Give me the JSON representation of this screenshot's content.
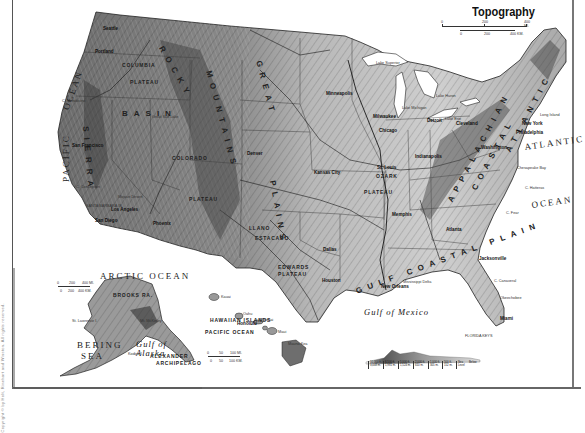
{
  "map": {
    "title": "Topography",
    "scale_main": {
      "miles": [
        "0",
        "200",
        "400 MI."
      ],
      "km": [
        "0",
        "200",
        "400 KM."
      ]
    },
    "scale_alaska": {
      "miles": [
        "0",
        "200",
        "400 MI."
      ],
      "km": [
        "0",
        "200",
        "400 KM."
      ]
    },
    "scale_hawaii": {
      "miles": [
        "0",
        "50",
        "100 MI."
      ],
      "km": [
        "0",
        "50",
        "100 KM."
      ]
    },
    "colors": {
      "land_light": "#d9d9d9",
      "land_mid": "#a8a8a8",
      "land_dark": "#5e5e5e",
      "water": "#ffffff",
      "lines": "#222222",
      "frame": "#666666"
    },
    "oceans": [
      {
        "id": "pacific",
        "text": "PACIFIC",
        "x": 62,
        "y": 182,
        "rot": -90
      },
      {
        "id": "ocean-west",
        "text": "OCEAN",
        "x": 62,
        "y": 108,
        "rot": -70
      },
      {
        "id": "atlantic",
        "text": "ATLANTIC",
        "x": 524,
        "y": 143,
        "rot": -8
      },
      {
        "id": "atlantic-ocean",
        "text": "OCEAN",
        "x": 531,
        "y": 201,
        "rot": -8
      },
      {
        "id": "arctic",
        "text": "ARCTIC OCEAN",
        "x": 100,
        "y": 272,
        "rot": 0
      },
      {
        "id": "bering",
        "text": "BERING",
        "x": 77,
        "y": 341,
        "rot": 0
      },
      {
        "id": "bering-sea",
        "text": "SEA",
        "x": 81,
        "y": 352,
        "rot": 0
      }
    ],
    "gulfs": [
      {
        "id": "gulf-of-mexico",
        "text": "Gulf of Mexico",
        "x": 364,
        "y": 308
      },
      {
        "id": "gulf-of-alaska",
        "text": "Gulf of\nAlaska",
        "x": 136,
        "y": 340
      }
    ],
    "regions": [
      {
        "id": "columbia-plateau",
        "text": "COLUMBIA",
        "x": 122,
        "y": 63
      },
      {
        "id": "columbia-plateau-2",
        "text": "PLATEAU",
        "x": 130,
        "y": 80
      },
      {
        "id": "colorado-plateau",
        "text": "COLORADO",
        "x": 172,
        "y": 156
      },
      {
        "id": "colorado-plateau-2",
        "text": "PLATEAU",
        "x": 189,
        "y": 197
      },
      {
        "id": "ozark-plateau",
        "text": "OZARK",
        "x": 376,
        "y": 174
      },
      {
        "id": "ozark-plateau-2",
        "text": "PLATEAU",
        "x": 364,
        "y": 190
      },
      {
        "id": "edwards-plateau",
        "text": "EDWARDS",
        "x": 278,
        "y": 265
      },
      {
        "id": "edwards-plateau-2",
        "text": "PLATEAU",
        "x": 278,
        "y": 272
      },
      {
        "id": "llano-estacado",
        "text": "LLANO",
        "x": 249,
        "y": 226
      },
      {
        "id": "llano-estacado-2",
        "text": "ESTACADO",
        "x": 255,
        "y": 236
      },
      {
        "id": "brooks-range",
        "text": "BROOKS RA.",
        "x": 113,
        "y": 293
      },
      {
        "id": "alexander-arch",
        "text": "ALEXANDER",
        "x": 150,
        "y": 354
      },
      {
        "id": "alexander-arch-2",
        "text": "ARCHIPELAGO",
        "x": 156,
        "y": 361
      },
      {
        "id": "hawaiian-islands",
        "text": "HAWAIIAN ISLANDS",
        "x": 210,
        "y": 318
      },
      {
        "id": "hawaii-pacific",
        "text": "PACIFIC OCEAN",
        "x": 205,
        "y": 330
      }
    ],
    "big_ranges": [
      {
        "id": "rocky",
        "text": "ROCKY",
        "x": 164,
        "y": 45,
        "rot": 60
      },
      {
        "id": "mountains",
        "text": "MOUNTAINS",
        "x": 212,
        "y": 70,
        "rot": 75
      },
      {
        "id": "great-plains",
        "text": "GREAT",
        "x": 262,
        "y": 60,
        "rot": 75
      },
      {
        "id": "plains",
        "text": "PLAINS",
        "x": 276,
        "y": 180,
        "rot": 80
      },
      {
        "id": "appalachian",
        "text": "APPALACHIAN",
        "x": 447,
        "y": 200,
        "rot": -62
      },
      {
        "id": "coastal",
        "text": "COASTAL",
        "x": 471,
        "y": 188,
        "rot": -62
      },
      {
        "id": "atlantic-plain",
        "text": "ATLANTIC",
        "x": 505,
        "y": 150,
        "rot": -62
      },
      {
        "id": "gulf-coastal-plain",
        "text": "GULF COASTAL PLAIN",
        "x": 355,
        "y": 288,
        "rot": -20
      },
      {
        "id": "sierra",
        "text": "SIERRA",
        "x": 89,
        "y": 126,
        "rot": 85
      },
      {
        "id": "basin",
        "text": "BASIN",
        "x": 122,
        "y": 110,
        "rot": 0
      }
    ],
    "cities": [
      {
        "id": "seattle",
        "text": "Seattle",
        "x": 103,
        "y": 27
      },
      {
        "id": "portland",
        "text": "Portland",
        "x": 95,
        "y": 50
      },
      {
        "id": "san-francisco",
        "text": "San Francisco",
        "x": 72,
        "y": 144
      },
      {
        "id": "los-angeles",
        "text": "Los Angeles",
        "x": 111,
        "y": 208
      },
      {
        "id": "san-diego",
        "text": "San Diego",
        "x": 95,
        "y": 219
      },
      {
        "id": "phoenix",
        "text": "Phoenix",
        "x": 153,
        "y": 222
      },
      {
        "id": "denver",
        "text": "Denver",
        "x": 247,
        "y": 152
      },
      {
        "id": "kansas-city",
        "text": "Kansas City",
        "x": 314,
        "y": 171
      },
      {
        "id": "st-louis",
        "text": "St. Louis",
        "x": 377,
        "y": 166
      },
      {
        "id": "minneapolis",
        "text": "Minneapolis",
        "x": 326,
        "y": 92
      },
      {
        "id": "milwaukee",
        "text": "Milwaukee",
        "x": 373,
        "y": 115
      },
      {
        "id": "chicago",
        "text": "Chicago",
        "x": 379,
        "y": 129
      },
      {
        "id": "detroit",
        "text": "Detroit",
        "x": 427,
        "y": 119
      },
      {
        "id": "cleveland",
        "text": "Cleveland",
        "x": 456,
        "y": 122
      },
      {
        "id": "indianapolis",
        "text": "Indianapolis",
        "x": 415,
        "y": 155
      },
      {
        "id": "new-york",
        "text": "New York",
        "x": 522,
        "y": 122
      },
      {
        "id": "philadelphia",
        "text": "Philadelphia",
        "x": 516,
        "y": 131
      },
      {
        "id": "washington",
        "text": "Washington",
        "x": 481,
        "y": 146
      },
      {
        "id": "atlanta",
        "text": "Atlanta",
        "x": 446,
        "y": 228
      },
      {
        "id": "memphis",
        "text": "Memphis",
        "x": 392,
        "y": 213
      },
      {
        "id": "dallas",
        "text": "Dallas",
        "x": 323,
        "y": 248
      },
      {
        "id": "houston",
        "text": "Houston",
        "x": 322,
        "y": 279
      },
      {
        "id": "new-orleans",
        "text": "New Orleans",
        "x": 381,
        "y": 285
      },
      {
        "id": "jacksonville",
        "text": "Jacksonville",
        "x": 479,
        "y": 257
      },
      {
        "id": "miami",
        "text": "Miami",
        "x": 500,
        "y": 317
      },
      {
        "id": "honolulu",
        "text": "Honolulu",
        "x": 237,
        "y": 322
      }
    ],
    "small_labels": [
      {
        "id": "mississippi-delta",
        "text": "Mississippi Delta",
        "x": 403,
        "y": 281
      },
      {
        "id": "florida-keys",
        "text": "FLORIDA KEYS",
        "x": 465,
        "y": 335
      },
      {
        "id": "c-canaveral",
        "text": "C. Canaveral",
        "x": 494,
        "y": 280
      },
      {
        "id": "okeechobee",
        "text": "Okeechobee",
        "x": 500,
        "y": 297
      },
      {
        "id": "chesapeake-bay",
        "text": "Chesapeake Bay",
        "x": 517,
        "y": 167
      },
      {
        "id": "c-hatteras",
        "text": "C. Hatteras",
        "x": 525,
        "y": 187
      },
      {
        "id": "c-fear",
        "text": "C. Fear",
        "x": 506,
        "y": 212
      },
      {
        "id": "long-island",
        "text": "Long Island",
        "x": 540,
        "y": 114
      },
      {
        "id": "santa-barbara",
        "text": "SANTA BARBARA IS.",
        "x": 86,
        "y": 205
      },
      {
        "id": "mojave-desert",
        "text": "Mojave Desert",
        "x": 118,
        "y": 196
      },
      {
        "id": "c-mendocino",
        "text": "C. Mendocino",
        "x": 62,
        "y": 100
      },
      {
        "id": "c-conception",
        "text": "C. Conception",
        "x": 76,
        "y": 186
      },
      {
        "id": "lake-superior",
        "text": "Lake Superior",
        "x": 376,
        "y": 62
      },
      {
        "id": "lake-michigan",
        "text": "Lake Michigan",
        "x": 402,
        "y": 107
      },
      {
        "id": "lake-huron",
        "text": "Lake Huron",
        "x": 436,
        "y": 95
      },
      {
        "id": "lake-erie",
        "text": "Lake Erie",
        "x": 445,
        "y": 118
      },
      {
        "id": "great-salt-lake",
        "text": "Great Salt Lake",
        "x": 152,
        "y": 116
      },
      {
        "id": "kauai",
        "text": "Kauai",
        "x": 221,
        "y": 296
      },
      {
        "id": "oahu",
        "text": "Oahu",
        "x": 243,
        "y": 313
      },
      {
        "id": "molokai",
        "text": "Molokai",
        "x": 260,
        "y": 319
      },
      {
        "id": "maui",
        "text": "Maui",
        "x": 278,
        "y": 331
      },
      {
        "id": "mauna-kea",
        "text": "Mauna Kea",
        "x": 288,
        "y": 343
      },
      {
        "id": "st-lawrence",
        "text": "St. Lawrence I.",
        "x": 72,
        "y": 320
      },
      {
        "id": "kodiak",
        "text": "Kodiak I.",
        "x": 128,
        "y": 353
      },
      {
        "id": "mt-mckinley",
        "text": "Mt. McKinley",
        "x": 140,
        "y": 320
      }
    ],
    "legend": {
      "cells": [
        "10,000 ft. 3,048 m.",
        "6,500 ft. 1,981 m.",
        "5,000 ft. 1,524 m.",
        "2,000 ft. 610 m.",
        "1,000 ft. 305 m.",
        "500 ft. 152 m.",
        "Sea Level",
        "Below"
      ]
    },
    "side_credit": "Copyright © by Holt, Rinehart and Winston. All rights reserved."
  }
}
